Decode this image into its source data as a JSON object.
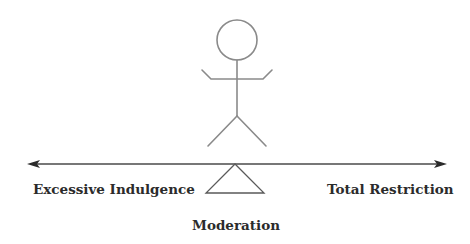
{
  "diagram": {
    "type": "balance-scale concept diagram",
    "figure": "stick-figure",
    "labels": {
      "left": "Excessive Indulgence",
      "right": "Total Restriction",
      "center": "Moderation"
    },
    "colors": {
      "figure_stroke": "#8a8a8a",
      "line_stroke": "#4a4a4a",
      "text": "#2b2b2b",
      "background": "#ffffff"
    }
  }
}
